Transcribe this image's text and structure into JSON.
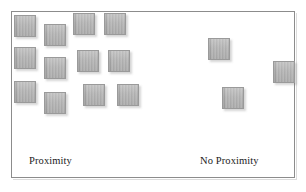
{
  "diagram": {
    "background_color": "#ffffff",
    "frame": {
      "border_color": "#8c8c8c",
      "x": 11,
      "y": 11,
      "width": 284,
      "height": 167
    },
    "square_style": {
      "fill_color": "#b2b2b2",
      "border_color": "#9a9a9a",
      "shadow_color": "#787878"
    },
    "captions": {
      "left": "Proximity",
      "right": "No Proximity"
    },
    "groups": [
      {
        "name": "proximity-group",
        "label": "Proximity",
        "count": 12,
        "squares": [
          {
            "x": 14,
            "y": 15,
            "w": 22,
            "h": 22
          },
          {
            "x": 44,
            "y": 24,
            "w": 22,
            "h": 22
          },
          {
            "x": 73,
            "y": 13,
            "w": 22,
            "h": 22
          },
          {
            "x": 104,
            "y": 13,
            "w": 22,
            "h": 22
          },
          {
            "x": 14,
            "y": 47,
            "w": 22,
            "h": 22
          },
          {
            "x": 44,
            "y": 57,
            "w": 22,
            "h": 22
          },
          {
            "x": 77,
            "y": 50,
            "w": 22,
            "h": 22
          },
          {
            "x": 108,
            "y": 50,
            "w": 22,
            "h": 22
          },
          {
            "x": 14,
            "y": 81,
            "w": 22,
            "h": 22
          },
          {
            "x": 44,
            "y": 92,
            "w": 22,
            "h": 22
          },
          {
            "x": 83,
            "y": 84,
            "w": 22,
            "h": 22
          },
          {
            "x": 117,
            "y": 84,
            "w": 22,
            "h": 22
          }
        ]
      },
      {
        "name": "no-proximity-group",
        "label": "No Proximity",
        "count": 3,
        "squares": [
          {
            "x": 208,
            "y": 38,
            "w": 22,
            "h": 22
          },
          {
            "x": 273,
            "y": 61,
            "w": 22,
            "h": 22
          },
          {
            "x": 222,
            "y": 87,
            "w": 22,
            "h": 22
          }
        ]
      }
    ],
    "caption_positions": {
      "left": {
        "x": 29,
        "y": 155
      },
      "right": {
        "x": 200,
        "y": 155
      }
    }
  }
}
